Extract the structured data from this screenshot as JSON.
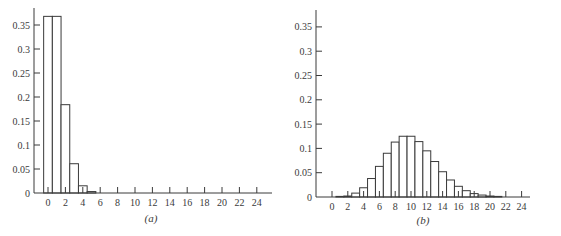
{
  "chart_data": [
    {
      "type": "bar",
      "title": "",
      "caption": "(a)",
      "xlabel": "",
      "ylabel": "",
      "x_ticks": [
        0,
        2,
        4,
        6,
        8,
        10,
        12,
        14,
        16,
        18,
        20,
        22,
        24
      ],
      "y_ticks": [
        "0",
        "0.05",
        "0.1",
        "0.15",
        "0.2",
        "0.25",
        "0.3",
        "0.35"
      ],
      "ylim": [
        0,
        0.385
      ],
      "xlim": [
        -1.6,
        26.5
      ],
      "grid": false,
      "legend": null,
      "categories": [
        0,
        1,
        2,
        3,
        4,
        5
      ],
      "values": [
        0.368,
        0.368,
        0.184,
        0.061,
        0.015,
        0.003
      ],
      "description": "Poisson distribution histogram, mean 1"
    },
    {
      "type": "bar",
      "title": "",
      "caption": "(b)",
      "xlabel": "",
      "ylabel": "",
      "x_ticks": [
        0,
        2,
        4,
        6,
        8,
        10,
        12,
        14,
        16,
        18,
        20,
        22,
        24
      ],
      "y_ticks": [
        "0",
        "0.05",
        "0.1",
        "0.15",
        "0.2",
        "0.25",
        "0.3",
        "0.35"
      ],
      "ylim": [
        0,
        0.385
      ],
      "xlim": [
        -2,
        26.5
      ],
      "grid": false,
      "legend": null,
      "categories": [
        1,
        2,
        3,
        4,
        5,
        6,
        7,
        8,
        9,
        10,
        11,
        12,
        13,
        14,
        15,
        16,
        17,
        18,
        19,
        20,
        21
      ],
      "values": [
        0.0005,
        0.002,
        0.008,
        0.019,
        0.038,
        0.063,
        0.09,
        0.113,
        0.125,
        0.125,
        0.114,
        0.095,
        0.073,
        0.052,
        0.035,
        0.022,
        0.013,
        0.007,
        0.004,
        0.002,
        0.001
      ],
      "description": "Poisson distribution histogram, mean 10"
    }
  ],
  "layout": [
    {
      "axis_x": 34,
      "base_y": 193,
      "x0": 48,
      "px_per_unit": 8.7,
      "px_per_prob": 480,
      "top_y": 8,
      "right_x": 272,
      "caption_x": 151,
      "caption_y": 222
    },
    {
      "axis_x": 316,
      "base_y": 197,
      "x0": 332,
      "px_per_unit": 7.9,
      "px_per_prob": 486,
      "top_y": 10,
      "right_x": 530,
      "caption_x": 423,
      "caption_y": 224
    }
  ],
  "colors": {
    "ink": "#3a3a3a",
    "background": "#ffffff"
  }
}
